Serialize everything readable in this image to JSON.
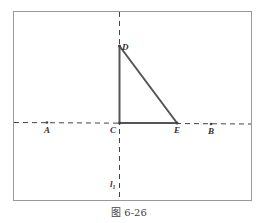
{
  "figure": {
    "caption": "图 6-26",
    "colors": {
      "frame": "#9a9a9a",
      "axis": "#444444",
      "triangle": "#555555",
      "label": "#333333"
    },
    "points": [
      {
        "name": "A",
        "x": 47,
        "y": 122
      },
      {
        "name": "C",
        "x": 119,
        "y": 123
      },
      {
        "name": "E",
        "x": 177,
        "y": 123
      },
      {
        "name": "B",
        "x": 211,
        "y": 124
      },
      {
        "name": "D",
        "x": 119,
        "y": 46
      }
    ],
    "labels": {
      "A": "A",
      "B": "B",
      "C": "C",
      "D": "D",
      "E": "E",
      "line_l1": "l",
      "line_l1_sub": "1"
    },
    "lines": {
      "horizontal_dashed": "line AB",
      "vertical_dashed": "l1"
    },
    "triangle": "CDE"
  }
}
